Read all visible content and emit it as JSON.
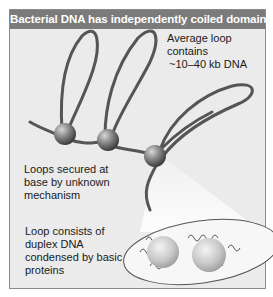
{
  "figure": {
    "title": "Bacterial DNA has independently coiled domains",
    "labels": {
      "loop_size_line1": "Average loop",
      "loop_size_line2": "contains",
      "loop_size_line3": "~10–40 kb DNA",
      "base_line1": "Loops secured at",
      "base_line2": "base by unknown",
      "base_line3": "mechanism",
      "composition_line1": "Loop consists of",
      "composition_line2": "duplex DNA",
      "composition_line3": "condensed by basic",
      "composition_line4": "proteins"
    },
    "colors": {
      "title_bar": "#7b7b7b",
      "background": "#ebebeb",
      "dna_strand": "#555555",
      "bead": "#8c8c8c",
      "inset_fill": "#f7f7f7"
    }
  }
}
